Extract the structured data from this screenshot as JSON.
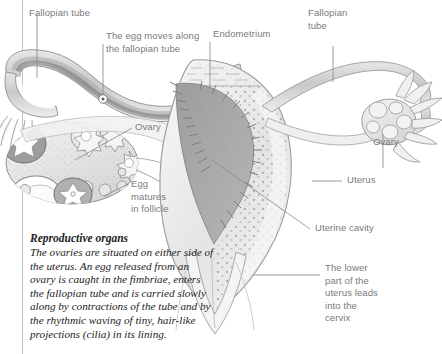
{
  "figure": {
    "title": "Reproductive organs",
    "alt_name": "female-reproductive-system-cross-section"
  },
  "labels": {
    "fallopian_tube_left": "Fallopian tube",
    "egg_moves": "The egg moves along\nthe fallopian tube",
    "endometrium": "Endometrium",
    "fallopian_tube_right": "Fallopian\ntube",
    "ovary_left": "Ovary",
    "ovary_right": "Ovary",
    "egg_matures": "Egg\nmatures\nin follicle",
    "uterus": "Uterus",
    "uterine_cavity": "Uterine cavity",
    "lower_part": "The lower\npart of the\nuterus leads\ninto the\ncervix"
  },
  "caption": {
    "title": "Reproductive organs",
    "body": "The ovaries are situated on either side of the uterus. An egg released from an ovary is caught in the fimbriae, enters the fallopian tube and is carried slowly along by contractions of the tube and by the rhythmic waving of tiny, hair-like projections (cilia) in its lining."
  },
  "colors": {
    "page_background": "#ffffff",
    "label_text": "#7a7a7a",
    "caption_text": "#1d1d1d",
    "leader_line": "#8d8d8d",
    "rule_line": "#b9b9b9",
    "tissue_light": "#efefef",
    "tissue_mid": "#d6d6d6",
    "tissue_outline": "#9a9a9a",
    "cavity_dark": "#a8a8a8",
    "tube_lumen": "#8f8f8f",
    "endometrium_stipple": "#8a8a8a"
  }
}
